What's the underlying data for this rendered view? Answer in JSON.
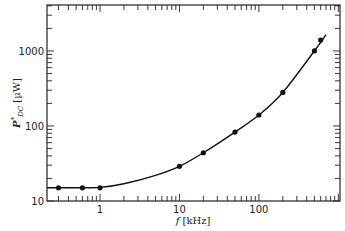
{
  "chart_data": {
    "type": "line",
    "title": "",
    "xlabel": "f [kHz]",
    "ylabel": "P*_DC [µW]",
    "xscale": "log",
    "yscale": "log",
    "xlim": [
      0.215,
      1050
    ],
    "ylim": [
      10,
      4100
    ],
    "grid": false,
    "legend": null,
    "x_ticks": [
      1,
      10,
      100
    ],
    "x_tick_labels": [
      "1",
      "10",
      "100"
    ],
    "y_ticks": [
      10,
      100,
      1000
    ],
    "y_tick_labels": [
      "10",
      "100",
      "1000"
    ],
    "series": [
      {
        "name": "measured",
        "style": "markers",
        "x": [
          0.3,
          0.6,
          1,
          10,
          20,
          50,
          100,
          200,
          500,
          600
        ],
        "y": [
          15,
          15,
          15,
          29,
          44,
          83,
          140,
          280,
          1000,
          1400
        ]
      },
      {
        "name": "fit",
        "style": "line",
        "x": [
          0.215,
          0.5,
          1,
          2,
          5,
          10,
          20,
          50,
          100,
          200,
          500,
          700
        ],
        "y": [
          15,
          15,
          15.2,
          17,
          22,
          29,
          44,
          83,
          140,
          280,
          1000,
          1650
        ]
      }
    ]
  },
  "labels": {
    "xlabel_f": "f",
    "xlabel_unit": " [kHz]",
    "ylabel_p": "P",
    "ylabel_sup": "*",
    "ylabel_sub": "DC",
    "ylabel_unit": " [µW]"
  }
}
